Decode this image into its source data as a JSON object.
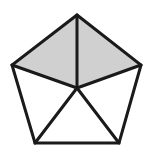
{
  "figure": {
    "shape_name": "pentagon",
    "shape_label": "regular pentagon",
    "canvas": {
      "width": 154,
      "height": 150
    },
    "colors": {
      "background": "#ffffff",
      "stroke": "#1a1a1a",
      "shaded_fill": "#d0d0d0",
      "unshaded_fill": "#ffffff"
    },
    "stroke_width": 3,
    "center_point": {
      "name": "center",
      "x": 77,
      "y": 88
    },
    "vertices": [
      {
        "name": "apex",
        "label": "top",
        "x": 77,
        "y": 15
      },
      {
        "name": "right-upper",
        "label": "right",
        "x": 141,
        "y": 65
      },
      {
        "name": "right-lower",
        "label": "bottom-right",
        "x": 119,
        "y": 143
      },
      {
        "name": "left-lower",
        "label": "bottom-left",
        "x": 35,
        "y": 143
      },
      {
        "name": "left-upper",
        "label": "left",
        "x": 12,
        "y": 65
      }
    ],
    "triangles": [
      {
        "name": "triangle-top-left",
        "shaded": true,
        "points": "77,15 12,65 77,88"
      },
      {
        "name": "triangle-top-right",
        "shaded": true,
        "points": "77,15 141,65 77,88"
      },
      {
        "name": "triangle-right",
        "shaded": false,
        "points": "141,65 119,143 77,88"
      },
      {
        "name": "triangle-bottom",
        "shaded": false,
        "points": "119,143 35,143 77,88"
      },
      {
        "name": "triangle-left",
        "shaded": false,
        "points": "35,143 12,65 77,88"
      }
    ],
    "outline_points": "77,15 141,65 119,143 35,143 12,65",
    "spokes": [
      {
        "name": "spoke-to-apex",
        "x1": 77,
        "y1": 88,
        "x2": 77,
        "y2": 15
      },
      {
        "name": "spoke-to-right-upper",
        "x1": 77,
        "y1": 88,
        "x2": 141,
        "y2": 65
      },
      {
        "name": "spoke-to-right-lower",
        "x1": 77,
        "y1": 88,
        "x2": 119,
        "y2": 143
      },
      {
        "name": "spoke-to-left-lower",
        "x1": 77,
        "y1": 88,
        "x2": 35,
        "y2": 143
      },
      {
        "name": "spoke-to-left-upper",
        "x1": 77,
        "y1": 88,
        "x2": 12,
        "y2": 65
      }
    ],
    "counts": {
      "total_triangles": 5,
      "shaded_triangles": 2,
      "unshaded_triangles": 3,
      "shaded_fraction_text": "2/5"
    }
  },
  "chart_data": {
    "type": "pie",
    "categories": [
      "triangle-top-left",
      "triangle-top-right",
      "triangle-right",
      "triangle-bottom",
      "triangle-left"
    ],
    "values": [
      20,
      20,
      20,
      20,
      20
    ],
    "shaded": [
      true,
      true,
      false,
      false,
      false
    ],
    "xlabel": "",
    "ylabel": "",
    "legend": [],
    "grid": false
  }
}
